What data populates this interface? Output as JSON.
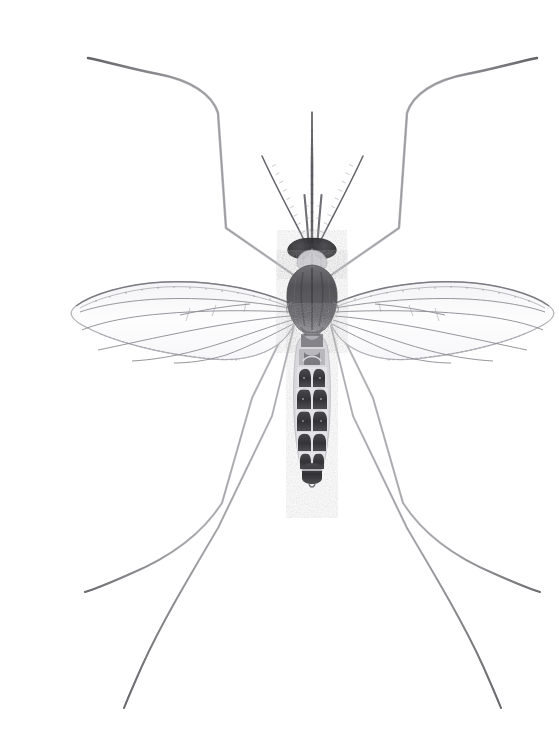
{
  "figure": {
    "title": "Mosquito specimen, dorsal view",
    "subject_common_name": "Mosquito",
    "view": "dorsal",
    "medium": "pencil-style scientific illustration on white",
    "background_color": "#ffffff",
    "canvas": {
      "width": 545,
      "height": 744
    }
  },
  "palette": {
    "background": "#ffffff",
    "ink_darkest": "#2f2f31",
    "ink_dark": "#4a4a4d",
    "ink_mid": "#6e6e72",
    "ink_light": "#9a9a9f",
    "ink_faint": "#c3c3c8",
    "wing_membrane": "#fbfbfc",
    "wing_vein": "#8e8e94",
    "thorax_fill": "#5d5d61",
    "abdomen_band": "#3b3b3e",
    "eye_fill": "#303033"
  },
  "anatomy": {
    "head": {
      "label": "head",
      "center": [
        272,
        231
      ],
      "eye_left": {
        "label": "left compound eye",
        "cx": 262,
        "cy": 230,
        "rx": 14,
        "ry": 9
      },
      "eye_right": {
        "label": "right compound eye",
        "cx": 283,
        "cy": 230,
        "rx": 14,
        "ry": 9
      },
      "clypeus": {
        "label": "clypeus",
        "cx": 272,
        "cy": 243,
        "rx": 12,
        "ry": 9
      }
    },
    "proboscis": {
      "label": "proboscis",
      "base": [
        272,
        226
      ],
      "tip": [
        272,
        96
      ],
      "width_base": 3.4,
      "width_tip": 0.9,
      "segment_ticks": 14
    },
    "palps": [
      {
        "label": "left maxillary palp",
        "base": [
          268,
          227
        ],
        "tip": [
          264,
          178
        ]
      },
      {
        "label": "right maxillary palp",
        "base": [
          277,
          227
        ],
        "tip": [
          281,
          178
        ]
      }
    ],
    "antennae": [
      {
        "label": "left antenna",
        "base": [
          266,
          228
        ],
        "tip": [
          221,
          139
        ],
        "segments": 13
      },
      {
        "label": "right antenna",
        "base": [
          279,
          228
        ],
        "tip": [
          324,
          139
        ],
        "segments": 13
      }
    ],
    "thorax": {
      "label": "thorax (scutum)",
      "cx": 272,
      "cy": 275,
      "rx": 20,
      "ry": 34,
      "scutellum": {
        "label": "scutellum",
        "cx": 272,
        "cy": 311,
        "rx": 11,
        "ry": 7
      },
      "midline_stripe": true
    },
    "abdomen": {
      "label": "abdomen",
      "top_y": 318,
      "bottom_y": 470,
      "segments": [
        {
          "index": 1,
          "y": 322,
          "half_width": 11,
          "height": 15,
          "band": "pale"
        },
        {
          "index": 2,
          "y": 338,
          "half_width": 13,
          "height": 17,
          "band": "pale-with-dark-edge"
        },
        {
          "index": 3,
          "y": 356,
          "half_width": 15,
          "height": 19,
          "band": "dark-paired-lobes"
        },
        {
          "index": 4,
          "y": 376,
          "half_width": 16,
          "height": 20,
          "band": "dark-paired-lobes"
        },
        {
          "index": 5,
          "y": 397,
          "half_width": 16,
          "height": 20,
          "band": "dark-paired-lobes"
        },
        {
          "index": 6,
          "y": 418,
          "half_width": 15,
          "height": 19,
          "band": "dark-paired-lobes"
        },
        {
          "index": 7,
          "y": 437,
          "half_width": 13,
          "height": 17,
          "band": "dark-paired-lobes"
        },
        {
          "index": 8,
          "y": 455,
          "half_width": 10,
          "height": 15,
          "band": "dark-rounded"
        }
      ],
      "cerci": {
        "label": "cerci",
        "cx": 272,
        "cy": 470
      }
    },
    "wings": [
      {
        "label": "left wing",
        "side": "left",
        "hinge": [
          252,
          289
        ],
        "tip": [
          33,
          296
        ],
        "leading_edge_dip": [
          140,
          272
        ],
        "trailing_edge_dip": [
          150,
          338
        ],
        "vein_count": 6
      },
      {
        "label": "right wing",
        "side": "right",
        "hinge": [
          293,
          289
        ],
        "tip": [
          512,
          296
        ],
        "leading_edge_dip": [
          405,
          272
        ],
        "trailing_edge_dip": [
          395,
          338
        ],
        "vein_count": 6
      }
    ],
    "legs": [
      {
        "label": "front left leg",
        "id": "leg-front-left",
        "joints": [
          [
            258,
            262
          ],
          [
            186,
            212
          ],
          [
            178,
            97
          ],
          [
            118,
            61
          ],
          [
            48,
            44
          ]
        ]
      },
      {
        "label": "front right leg",
        "id": "leg-front-right",
        "joints": [
          [
            287,
            262
          ],
          [
            359,
            212
          ],
          [
            367,
            97
          ],
          [
            427,
            61
          ],
          [
            497,
            44
          ]
        ]
      },
      {
        "label": "middle left leg",
        "id": "leg-middle-left",
        "joints": [
          [
            256,
            292
          ],
          [
            212,
            382
          ],
          [
            182,
            487
          ],
          [
            110,
            549
          ],
          [
            45,
            578
          ]
        ]
      },
      {
        "label": "middle right leg",
        "id": "leg-middle-right",
        "joints": [
          [
            289,
            292
          ],
          [
            333,
            382
          ],
          [
            363,
            487
          ],
          [
            435,
            549
          ],
          [
            500,
            578
          ]
        ]
      },
      {
        "label": "hind left leg",
        "id": "leg-hind-left",
        "joints": [
          [
            254,
            310
          ],
          [
            232,
            400
          ],
          [
            178,
            512
          ],
          [
            120,
            615
          ],
          [
            85,
            690
          ]
        ]
      },
      {
        "label": "hind right leg",
        "id": "leg-hind-right",
        "joints": [
          [
            291,
            310
          ],
          [
            313,
            400
          ],
          [
            367,
            512
          ],
          [
            425,
            615
          ],
          [
            460,
            690
          ]
        ]
      }
    ]
  }
}
